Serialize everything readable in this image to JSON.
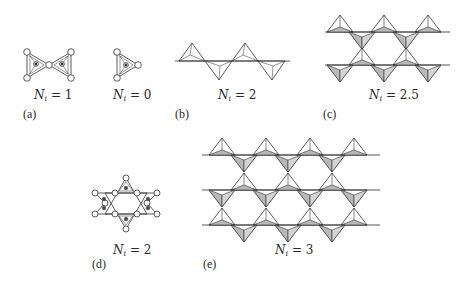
{
  "figure": {
    "panels": [
      {
        "id": "a",
        "letter": "(a)",
        "items": [
          {
            "label_var": "N",
            "label_sub": "i",
            "label_value": "= 1",
            "structure": "two corner-sharing triangles (bow-tie) with central cations"
          },
          {
            "label_var": "N",
            "label_sub": "i",
            "label_value": "= 0",
            "structure": "isolated triangle with central cation"
          }
        ]
      },
      {
        "id": "b",
        "letter": "(b)",
        "label_var": "N",
        "label_sub": "i",
        "label_value": "= 2",
        "structure": "single chain of alternating up/down tetrahedra"
      },
      {
        "id": "c",
        "letter": "(c)",
        "label_var": "N",
        "label_sub": "i",
        "label_value": "= 2.5",
        "structure": "double chain (ladder) of tetrahedra"
      },
      {
        "id": "d",
        "letter": "(d)",
        "label_var": "N",
        "label_sub": "i",
        "label_value": "= 2",
        "structure": "six-membered ring (hexagram) of tetrahedra"
      },
      {
        "id": "e",
        "letter": "(e)",
        "label_var": "N",
        "label_sub": "i",
        "label_value": "= 3",
        "structure": "sheet of tetrahedra (three rows)"
      }
    ],
    "colors": {
      "line": "#333333",
      "shade": "#b8b8b8",
      "node_fill": "#ffffff"
    }
  }
}
